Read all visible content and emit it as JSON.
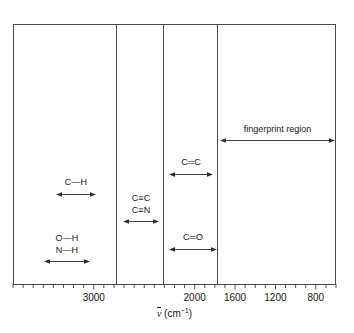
{
  "chart_data": {
    "type": "table",
    "title": "",
    "xlabel": "ν̄ (cm⁻¹)",
    "ylabel": "",
    "xlim": [
      3800,
      600
    ],
    "x_axis_direction": "decreasing",
    "grid": false,
    "legend": "none",
    "axis": {
      "symbol": "ν",
      "overbar": true,
      "unit_prefix": "(cm",
      "unit_exponent": "−1",
      "unit_suffix": ")",
      "tick_labels": [
        "3000",
        "2000",
        "1600",
        "1200",
        "800"
      ],
      "tick_values": [
        3000,
        2000,
        1600,
        1200,
        800
      ],
      "minor_tick_step": 100
    },
    "dividers": [
      2700,
      1950,
      1680
    ],
    "bands": [
      {
        "id": "c-h",
        "labels": [
          "C—H"
        ],
        "bond_order": 1,
        "range": [
          3100,
          2800
        ],
        "arrow": "double-headed"
      },
      {
        "id": "o-h-n-h",
        "labels": [
          "O—H",
          "N—H"
        ],
        "bond_order": 1,
        "range": [
          3650,
          3200
        ],
        "arrow": "double-headed"
      },
      {
        "id": "c-triple-c-n",
        "labels": [
          "C≡C",
          "C≡N"
        ],
        "bond_order": 3,
        "range": [
          2260,
          2100
        ],
        "arrow": "double-headed"
      },
      {
        "id": "c-double-c",
        "labels": [
          "C═C"
        ],
        "bond_order": 2,
        "range": [
          1680,
          1600
        ],
        "arrow": "double-headed"
      },
      {
        "id": "c-double-o",
        "labels": [
          "C═O"
        ],
        "bond_order": 2,
        "range": [
          1780,
          1650
        ],
        "arrow": "double-headed"
      }
    ],
    "regions": [
      {
        "id": "fingerprint",
        "label": "fingerprint region",
        "range": [
          1500,
          650
        ],
        "arrow": "double-headed"
      }
    ]
  },
  "colors": {
    "frame": "#4a4a4a",
    "text": "#161616",
    "arrow": "#2b2b2b",
    "background": "#ffffff"
  }
}
